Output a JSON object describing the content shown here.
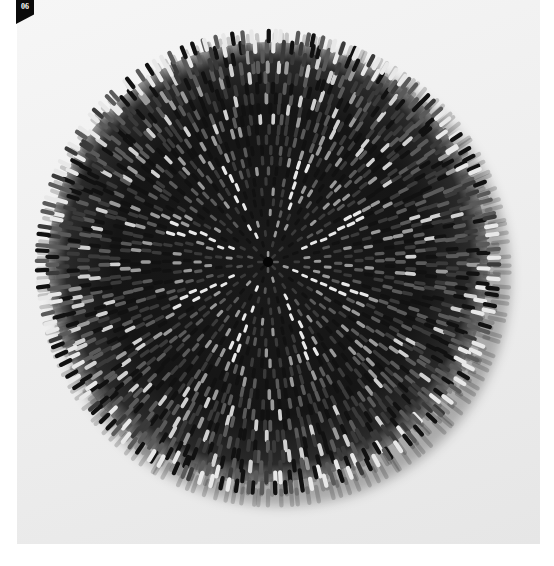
{
  "page": {
    "number_badge": "06"
  },
  "photo": {
    "subject": "radial sculpture of small cylindrical elements",
    "background_colors": [
      "#f6f6f6",
      "#efefef",
      "#e6e6e6"
    ],
    "sculpture": {
      "center_x": 251,
      "center_y": 262,
      "radius": 224,
      "rings": 22,
      "base_color": "#111111",
      "mid_color": "#3a3a3a",
      "highlight_color": "#e8e8e8",
      "shadow_color": "rgba(0,0,0,0.28)",
      "white_spokes": 8
    }
  }
}
